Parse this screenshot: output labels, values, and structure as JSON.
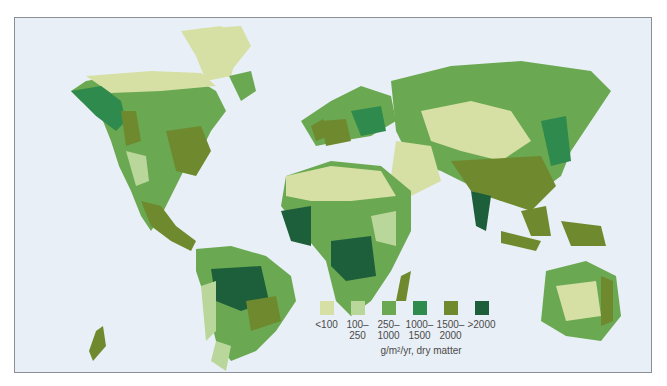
{
  "map": {
    "title": "World net primary productivity",
    "background_color": "#e9eff6",
    "legend": {
      "unit_label": "g/m²/yr, dry matter",
      "classes": [
        {
          "label": "<100",
          "color": "#d6e0a4"
        },
        {
          "label": "100–\n250",
          "color": "#b9d79b"
        },
        {
          "label": "250–\n1000",
          "color": "#6aa852"
        },
        {
          "label": "1000–\n1500",
          "color": "#2f8a4e"
        },
        {
          "label": "1500–\n2000",
          "color": "#6f8a2e"
        },
        {
          "label": ">2000",
          "color": "#1d5e3b"
        }
      ]
    }
  }
}
